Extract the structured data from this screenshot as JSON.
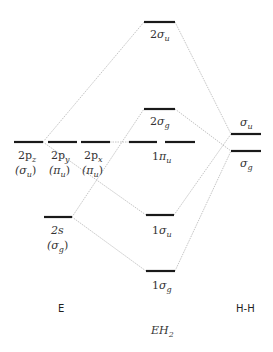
{
  "diagram": {
    "title": "EH",
    "title_sub": "2",
    "left_label": "E",
    "right_label": "H-H",
    "mo_levels": [
      {
        "id": "2su",
        "num": "2",
        "sym": "σ",
        "sub": "u"
      },
      {
        "id": "2sg",
        "num": "2",
        "sym": "σ",
        "sub": "g"
      },
      {
        "id": "1pu",
        "num": "1",
        "sym": "π",
        "sub": "u"
      },
      {
        "id": "1su",
        "num": "1",
        "sym": "σ",
        "sub": "u"
      },
      {
        "id": "1sg",
        "num": "1",
        "sym": "σ",
        "sub": "g"
      }
    ],
    "e_levels": [
      {
        "id": "2pz",
        "top": "2p",
        "top_sub": "z",
        "sym": "(σ",
        "sym_sub": "u",
        "close": ")"
      },
      {
        "id": "2py",
        "top": "2p",
        "top_sub": "y",
        "sym": "(π",
        "sym_sub": "u",
        "close": ")"
      },
      {
        "id": "2px",
        "top": "2p",
        "top_sub": "x",
        "sym": "(π",
        "sym_sub": "u",
        "close": ")"
      },
      {
        "id": "2s",
        "top": "2s",
        "top_sub": "",
        "sym": "(σ",
        "sym_sub": "g",
        "close": ")"
      }
    ],
    "hh_levels": [
      {
        "id": "hh_su",
        "sym": "σ",
        "sub": "u"
      },
      {
        "id": "hh_sg",
        "sym": "σ",
        "sub": "g"
      }
    ]
  }
}
